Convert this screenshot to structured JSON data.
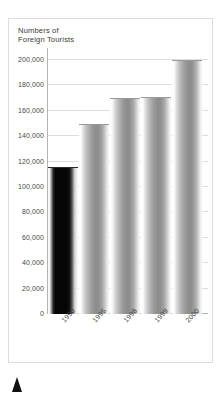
{
  "chart_data": {
    "type": "bar",
    "title": "Numbers of\nForeign Tourists",
    "xlabel": "",
    "ylabel": "",
    "categories": [
      "1990",
      "1995",
      "1998",
      "1999",
      "2000"
    ],
    "values": [
      116000,
      150000,
      170000,
      171000,
      200000
    ],
    "ylim": [
      0,
      200000
    ],
    "yticks": [
      0,
      20000,
      40000,
      60000,
      80000,
      100000,
      120000,
      140000,
      160000,
      180000,
      200000
    ],
    "ytick_labels": [
      "0",
      "20,000",
      "40,000",
      "60,000",
      "80,000",
      "100,000",
      "120,000",
      "140,000",
      "160,000",
      "180,000",
      "200,000"
    ],
    "grid": true,
    "legend": false,
    "series": [
      {
        "name": "Foreign Tourists",
        "values": [
          116000,
          150000,
          170000,
          171000,
          200000
        ]
      }
    ],
    "bar_styles": [
      "dark",
      "light",
      "light",
      "light",
      "light"
    ],
    "colors": {
      "bar_light": "#8c8c8c",
      "bar_dark": "#050505",
      "gridline": "#dedede",
      "axis": "#b4b4b4",
      "text": "#3b3b3b",
      "frame": "#dcdcdc",
      "background": "#ffffff",
      "marker": "#111111"
    }
  },
  "marker": {
    "name": "up-triangle"
  }
}
